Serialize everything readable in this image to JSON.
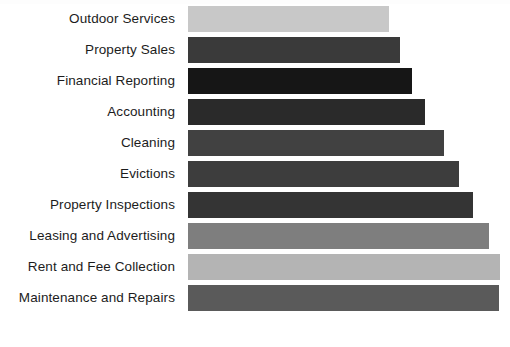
{
  "chart_data": {
    "type": "bar",
    "orientation": "horizontal",
    "title": "",
    "xlabel": "",
    "ylabel": "",
    "grid": false,
    "legend": false,
    "axis_visible": false,
    "value_labels_shown": false,
    "xlim": [
      0,
      312
    ],
    "categories": [
      "Outdoor Services",
      "Property Sales",
      "Financial Reporting",
      "Accounting",
      "Cleaning",
      "Evictions",
      "Property Inspections",
      "Leasing and Advertising",
      "Rent and Fee Collection",
      "Maintenance and Repairs"
    ],
    "values": [
      201,
      212,
      224,
      237,
      256,
      271,
      285,
      301,
      312,
      311
    ],
    "bar_colors": [
      "#c8c8c8",
      "#3a3a3a",
      "#161616",
      "#2a2a2a",
      "#414141",
      "#3d3d3d",
      "#343434",
      "#7e7e7e",
      "#b4b4b4",
      "#5a5a5a"
    ],
    "background_color": "#ffffff",
    "label_color": "#1c1c1c"
  }
}
